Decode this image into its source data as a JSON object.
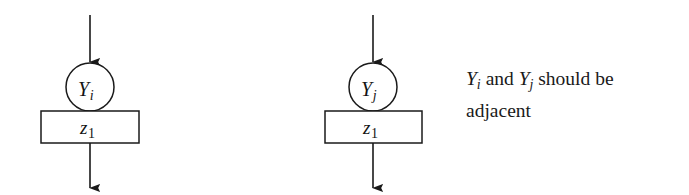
{
  "figure": {
    "background_color": "#ffffff",
    "stroke_color": "#1a1a1a",
    "units": [
      {
        "id": "left",
        "offset_x": 0,
        "axis_x": 90,
        "circle": {
          "cx": 90,
          "cy": 87,
          "r": 24,
          "symbol": "Y",
          "subscript": "i"
        },
        "box": {
          "x": 41,
          "y": 111,
          "width": 98,
          "height": 32,
          "symbol": "z",
          "subscript": "1"
        },
        "arrow_in": {
          "x": 90,
          "y1": 15,
          "y2": 63
        },
        "arrow_out": {
          "x": 90,
          "y1": 143,
          "y2": 189
        }
      },
      {
        "id": "right",
        "offset_x": 283,
        "axis_x": 373,
        "circle": {
          "cx": 373,
          "cy": 87,
          "r": 24,
          "symbol": "Y",
          "subscript": "j"
        },
        "box": {
          "x": 325,
          "y": 111,
          "width": 97,
          "height": 32,
          "symbol": "z",
          "subscript": "1"
        },
        "arrow_in": {
          "x": 373,
          "y1": 15,
          "y2": 63
        },
        "arrow_out": {
          "x": 373,
          "y1": 143,
          "y2": 189
        }
      }
    ]
  },
  "caption": {
    "var1_symbol": "Y",
    "var1_subscript": "i",
    "conjunction": " and ",
    "var2_symbol": "Y",
    "var2_subscript": "j",
    "predicate": " should be adjacent",
    "plain_text": "Yi and Yj should be adjacent"
  }
}
